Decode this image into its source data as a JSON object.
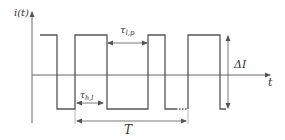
{
  "diagram": {
    "type": "pulse-waveform",
    "colors": {
      "line": "#555555",
      "axis": "#666666",
      "text": "#333333",
      "background": "#ffffff"
    },
    "axes": {
      "y_label": "i(t)",
      "x_label": "t"
    },
    "annotations": {
      "tau_lp": {
        "symbol": "τ",
        "subscript": "l,p"
      },
      "tau_hl": {
        "symbol": "τ",
        "subscript": "h,l"
      },
      "delta_i": "ΔI",
      "period": "T"
    },
    "levels": {
      "high_y": 35,
      "low_y": 109,
      "zero_y": 75
    },
    "waveform_points": [
      [
        40,
        35
      ],
      [
        57,
        35
      ],
      [
        57,
        109
      ],
      [
        75,
        109
      ],
      [
        75,
        35
      ],
      [
        107,
        35
      ],
      [
        107,
        109
      ],
      [
        148,
        109
      ],
      [
        148,
        35
      ],
      [
        165,
        35
      ],
      [
        165,
        109
      ],
      [
        188,
        109
      ],
      [
        188,
        35
      ],
      [
        220,
        35
      ],
      [
        220,
        109
      ],
      [
        226,
        109
      ]
    ]
  }
}
